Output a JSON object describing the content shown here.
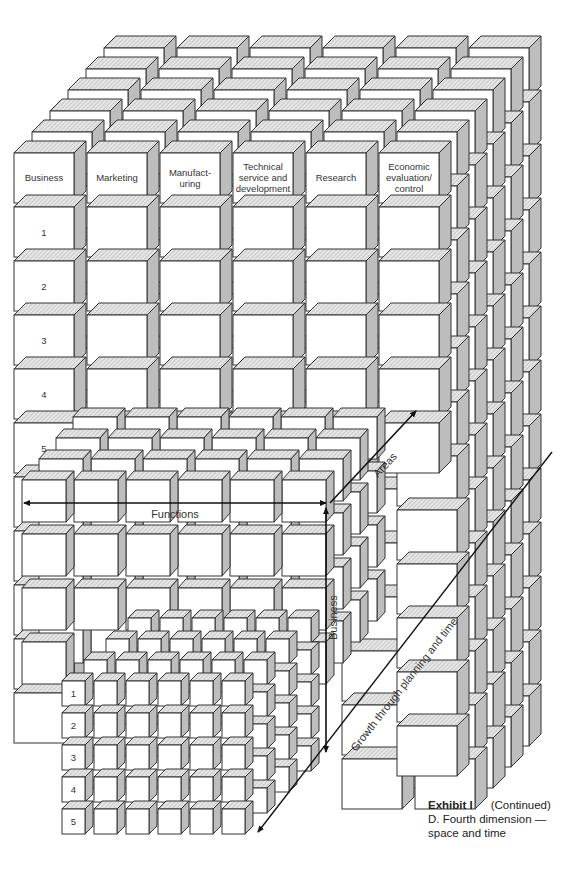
{
  "diagram": {
    "title": "Fourth dimension — space and time",
    "large_grid": {
      "column_headers": [
        "Business",
        "Marketing",
        "Manufact-\nuring",
        "Technical\nservice and\ndevelopment",
        "Research",
        "Economic\nevaluation/\ncontrol"
      ],
      "row_labels": [
        "1",
        "2",
        "3",
        "4",
        "5"
      ],
      "columns": 6,
      "rows": 13,
      "layers": 6
    },
    "medium_grid": {
      "columns": 6,
      "rows": 4,
      "layers": 4
    },
    "small_grid": {
      "row_labels": [
        "1",
        "2",
        "3",
        "4",
        "5"
      ],
      "columns": 6,
      "rows": 5,
      "layers": 4
    },
    "axes": {
      "functions": "Functions",
      "areas": "Areas",
      "business": "Business",
      "growth": "Growth through planning and time"
    }
  },
  "caption": {
    "exhibit": "Exhibit I",
    "continued": "(Continued)",
    "line1": "D. Fourth dimension —",
    "line2": "space and time"
  }
}
